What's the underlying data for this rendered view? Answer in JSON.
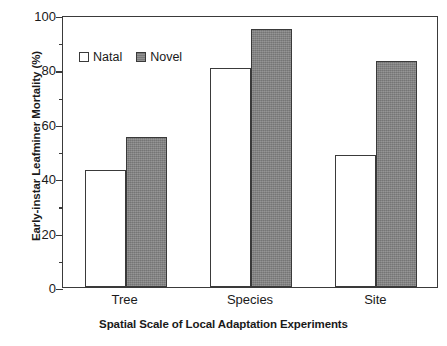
{
  "chart_data": {
    "type": "bar",
    "title": "",
    "xlabel": "Spatial Scale of Local Adaptation Experiments",
    "ylabel": "Early-instar Leafminer Mortality (%)",
    "categories": [
      "Tree",
      "Species",
      "Site"
    ],
    "series": [
      {
        "name": "Natal",
        "values": [
          43,
          80.5,
          48.5
        ],
        "fill": "#ffffff",
        "edge": "#3a3a3a"
      },
      {
        "name": "Novel",
        "values": [
          55,
          95,
          83
        ],
        "fill": "#808080",
        "edge": "#3a3a3a"
      }
    ],
    "ylim": [
      0,
      100
    ],
    "yticks": [
      0,
      20,
      40,
      60,
      80,
      100
    ],
    "ytick_labels": [
      "0",
      "20",
      "40",
      "60",
      "80",
      "100"
    ],
    "yminor_ticks": [
      10,
      30,
      50,
      70,
      90
    ],
    "grid": false,
    "legend_position": "upper left",
    "legend_entries": [
      "Natal",
      "Novel"
    ]
  },
  "axes": {
    "y_title": "Early-instar Leafminer Mortality (%)",
    "x_title": "Spatial Scale of Local Adaptation Experiments",
    "y_tick_0": "0",
    "y_tick_1": "20",
    "y_tick_2": "40",
    "y_tick_3": "60",
    "y_tick_4": "80",
    "y_tick_5": "100",
    "x_tick_0": "Tree",
    "x_tick_1": "Species",
    "x_tick_2": "Site"
  },
  "legend": {
    "natal_label": "Natal",
    "novel_label": "Novel"
  }
}
